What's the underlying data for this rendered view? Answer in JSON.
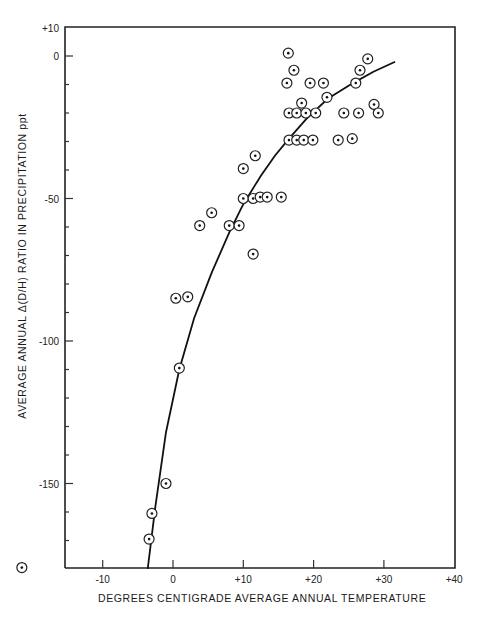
{
  "chart_data": {
    "type": "scatter",
    "title": "",
    "xlabel": "DEGREES CENTIGRADE AVERAGE ANNUAL TEMPERATURE",
    "ylabel": "AVERAGE ANNUAL Δ(D/H) RATIO IN PRECIPITATION ppt",
    "xlim": [
      -16.5,
      40
    ],
    "ylim": [
      -180,
      10
    ],
    "x_ticks": [
      "-10",
      "0",
      "+10",
      "+20",
      "+30",
      "+40"
    ],
    "x_tick_values": [
      -10,
      0,
      10,
      20,
      30,
      40
    ],
    "y_ticks": [
      "+10",
      "0",
      "-50",
      "-100",
      "-150"
    ],
    "y_tick_values": [
      10,
      0,
      -50,
      -100,
      -150
    ],
    "y_minor_tick_step": 10,
    "grid": false,
    "legend": null,
    "marker": "circle-dot",
    "series": [
      {
        "name": "observations",
        "points": [
          [
            16.4,
            1
          ],
          [
            17.2,
            -5
          ],
          [
            16.2,
            -9.5
          ],
          [
            19.5,
            -9.5
          ],
          [
            21.4,
            -9.5
          ],
          [
            26.0,
            -9.5
          ],
          [
            27.7,
            -1
          ],
          [
            26.6,
            -5
          ],
          [
            18.3,
            -16.5
          ],
          [
            21.9,
            -14.5
          ],
          [
            16.5,
            -20
          ],
          [
            17.6,
            -20
          ],
          [
            18.9,
            -20
          ],
          [
            20.3,
            -20
          ],
          [
            24.3,
            -20
          ],
          [
            26.4,
            -20
          ],
          [
            28.6,
            -17
          ],
          [
            29.2,
            -20
          ],
          [
            16.5,
            -29.5
          ],
          [
            17.6,
            -29.5
          ],
          [
            18.6,
            -29.5
          ],
          [
            19.9,
            -29.5
          ],
          [
            23.5,
            -29.5
          ],
          [
            25.5,
            -29
          ],
          [
            11.7,
            -35
          ],
          [
            10.0,
            -39.5
          ],
          [
            10.0,
            -50
          ],
          [
            11.4,
            -50
          ],
          [
            12.4,
            -49.5
          ],
          [
            13.4,
            -49.5
          ],
          [
            15.4,
            -49.5
          ],
          [
            5.5,
            -55
          ],
          [
            3.8,
            -59.5
          ],
          [
            8.0,
            -59.5
          ],
          [
            9.4,
            -59.5
          ],
          [
            11.4,
            -69.5
          ],
          [
            0.4,
            -85
          ],
          [
            2.1,
            -84.5
          ],
          [
            0.9,
            -109.5
          ],
          [
            -1.0,
            -150
          ],
          [
            -3.0,
            -160.5
          ],
          [
            -3.4,
            -169.5
          ],
          [
            -21.5,
            -179.5
          ]
        ]
      },
      {
        "name": "fitted curve",
        "type": "line",
        "x": [
          -3.6,
          -2.5,
          -1,
          0.9,
          3,
          5.5,
          8,
          10,
          12.5,
          14.5,
          16.5,
          19,
          22,
          25.6,
          28.5,
          31.6
        ],
        "y": [
          -180,
          -158,
          -132,
          -110,
          -92,
          -76,
          -62,
          -52,
          -42,
          -35,
          -29,
          -22,
          -15,
          -9.5,
          -5.5,
          -2
        ]
      }
    ]
  }
}
